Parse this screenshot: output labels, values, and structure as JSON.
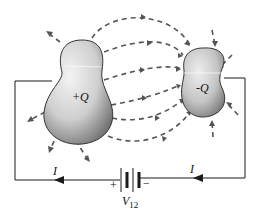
{
  "diagram": {
    "title": "",
    "conductor_left": {
      "label": "+Q"
    },
    "conductor_right": {
      "label": "-Q"
    },
    "battery": {
      "label_main": "V",
      "label_sub": "12",
      "plus": "+",
      "minus": "−"
    },
    "current_left": {
      "label": "I"
    },
    "current_right": {
      "label": "I"
    },
    "colors": {
      "wire": "#1a1a1a",
      "field_line": "#555555",
      "conductor_light": "#f2f2f2",
      "conductor_dark": "#7a7a7a",
      "outline": "#333333"
    },
    "icons": {
      "field_arrow": "arrow-head",
      "current_arrow": "arrow-head-left"
    }
  }
}
